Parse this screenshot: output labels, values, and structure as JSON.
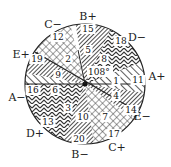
{
  "diagram": {
    "type": "patterned circle sectors",
    "center_angle_label": "108°",
    "outer_labels": [
      {
        "text": "B+",
        "x": 88,
        "y": 20
      },
      {
        "text": "C−",
        "x": 53,
        "y": 28
      },
      {
        "text": "D−",
        "x": 137,
        "y": 41
      },
      {
        "text": "E+",
        "x": 21,
        "y": 58
      },
      {
        "text": "A+",
        "x": 157,
        "y": 80
      },
      {
        "text": "A−",
        "x": 17,
        "y": 101
      },
      {
        "text": "E−",
        "x": 142,
        "y": 120
      },
      {
        "text": "D+",
        "x": 35,
        "y": 137
      },
      {
        "text": "C+",
        "x": 117,
        "y": 151
      },
      {
        "text": "B−",
        "x": 80,
        "y": 158
      }
    ],
    "region_numbers": [
      {
        "text": "1",
        "x": 116,
        "y": 84
      },
      {
        "text": "2",
        "x": 68,
        "y": 62
      },
      {
        "text": "3",
        "x": 68,
        "y": 111
      },
      {
        "text": "4",
        "x": 116,
        "y": 99
      },
      {
        "text": "5",
        "x": 88,
        "y": 53
      },
      {
        "text": "6",
        "x": 55,
        "y": 93
      },
      {
        "text": "7",
        "x": 105,
        "y": 120
      },
      {
        "text": "8",
        "x": 104,
        "y": 62
      },
      {
        "text": "9",
        "x": 58,
        "y": 78
      },
      {
        "text": "10",
        "x": 83,
        "y": 120
      },
      {
        "text": "11",
        "x": 138,
        "y": 83
      },
      {
        "text": "12",
        "x": 58,
        "y": 40
      },
      {
        "text": "13",
        "x": 48,
        "y": 125
      },
      {
        "text": "14",
        "x": 131,
        "y": 113
      },
      {
        "text": "15",
        "x": 88,
        "y": 32
      },
      {
        "text": "16",
        "x": 33,
        "y": 93
      },
      {
        "text": "17",
        "x": 114,
        "y": 137
      },
      {
        "text": "18",
        "x": 121,
        "y": 44
      },
      {
        "text": "19",
        "x": 37,
        "y": 62
      },
      {
        "text": "20",
        "x": 79,
        "y": 142
      }
    ]
  }
}
